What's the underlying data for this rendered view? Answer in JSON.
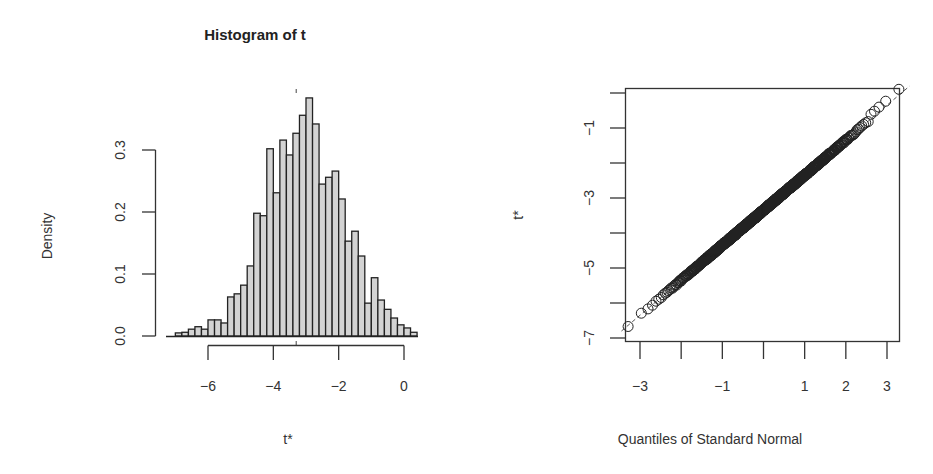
{
  "chart_data": [
    {
      "type": "bar",
      "subtype": "histogram",
      "title": "Histogram of t",
      "xlabel": "t*",
      "ylabel": "Density",
      "xlim": [
        -7.0,
        0.4
      ],
      "ylim": [
        0,
        0.39
      ],
      "x_ticks": [
        -6,
        -4,
        -2,
        0
      ],
      "x_tick_labels": [
        "-6",
        "-4",
        "-2",
        "0"
      ],
      "y_ticks": [
        0.0,
        0.1,
        0.2,
        0.3
      ],
      "y_tick_labels": [
        "0.0",
        "0.1",
        "0.2",
        "0.3"
      ],
      "bin_width": 0.2,
      "bin_start": -7.0,
      "values": [
        0.005,
        0.006,
        0.011,
        0.015,
        0.011,
        0.026,
        0.026,
        0.021,
        0.063,
        0.068,
        0.082,
        0.113,
        0.198,
        0.194,
        0.302,
        0.231,
        0.316,
        0.292,
        0.327,
        0.356,
        0.384,
        0.342,
        0.245,
        0.256,
        0.266,
        0.221,
        0.153,
        0.169,
        0.129,
        0.053,
        0.094,
        0.058,
        0.043,
        0.029,
        0.018,
        0.013,
        0.006
      ],
      "vline_marker_x": -3.3,
      "grid": false,
      "bar_fill": "#d3d3d3",
      "bar_stroke": "#222222"
    },
    {
      "type": "scatter",
      "subtype": "qq-plot",
      "title": "",
      "xlabel": "Quantiles of Standard Normal",
      "ylabel": "t*",
      "xlim": [
        -3.35,
        3.3
      ],
      "ylim": [
        -7.1,
        0.15
      ],
      "x_ticks": [
        -3,
        -2,
        -1,
        0,
        1,
        2,
        3
      ],
      "x_tick_labels": [
        "-3",
        "",
        "-1",
        "",
        "1",
        "2",
        "3"
      ],
      "y_ticks": [
        -7,
        -6,
        -5,
        -4,
        -3,
        -2,
        -1,
        0
      ],
      "y_tick_labels": [
        "-7",
        "",
        "-5",
        "",
        "-3",
        "",
        "-1",
        ""
      ],
      "reference_line": {
        "intercept": -3.35,
        "slope": 1.0,
        "style": "dashed"
      },
      "points_description": "Approx. 1000 points along line t* ≈ -3.35 + 1.0·z, from (-3.0,-6.85) to (3.05,-0.15)",
      "marker": "open-circle",
      "grid": false
    }
  ]
}
